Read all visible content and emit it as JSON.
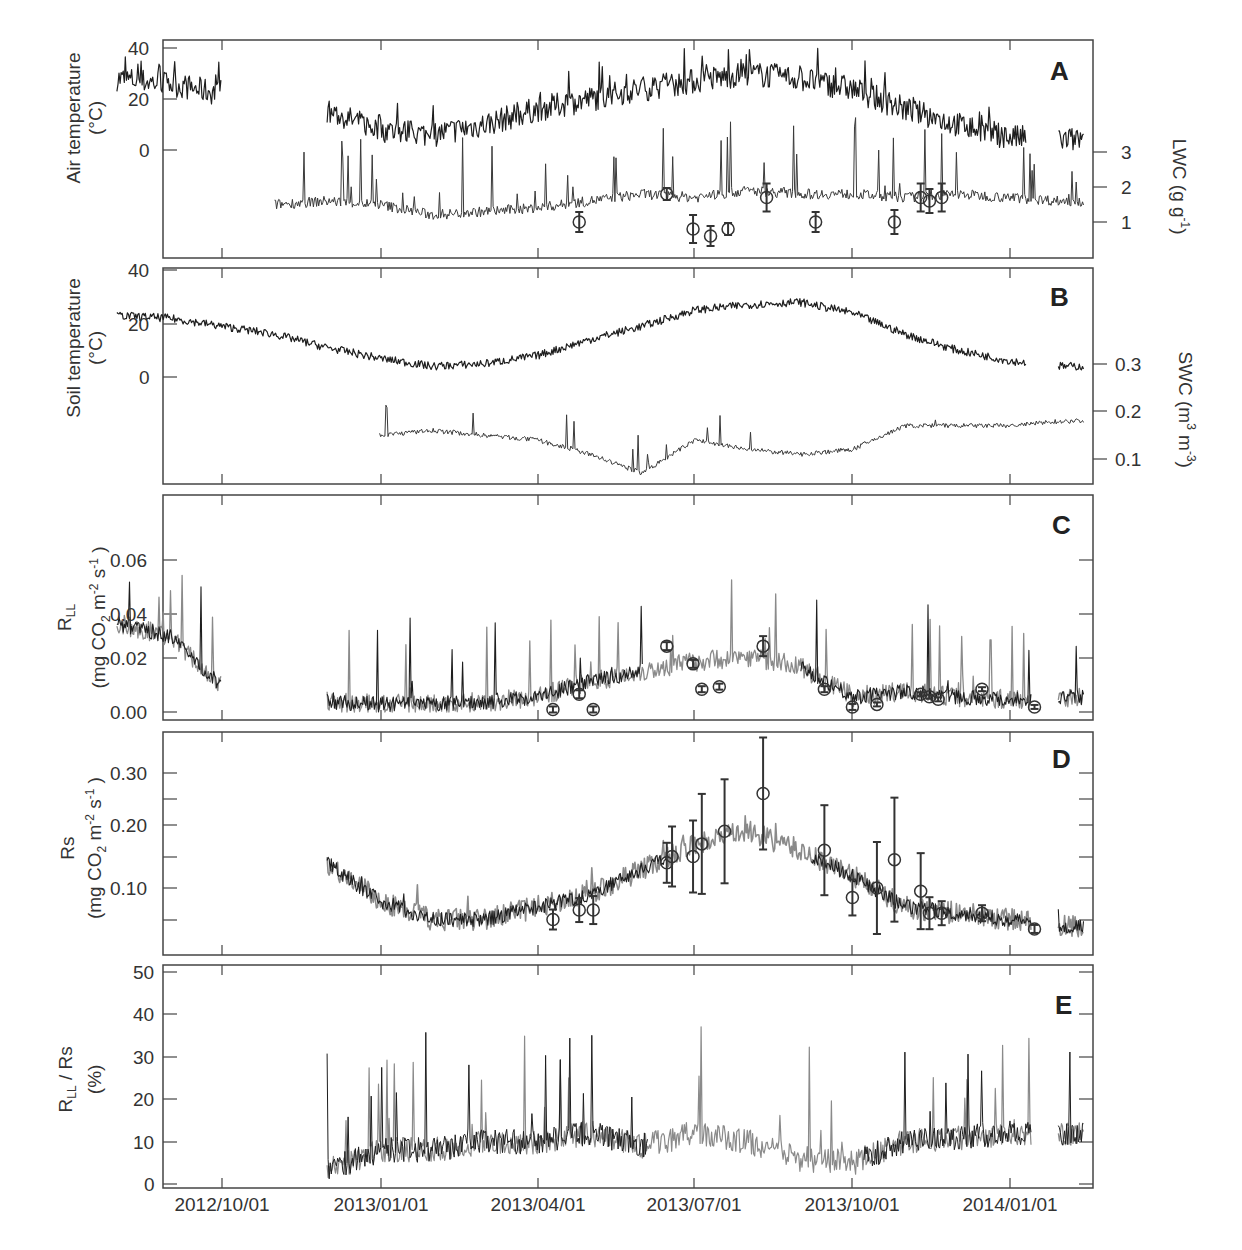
{
  "figure": {
    "x_tick_labels": [
      "2012/10/01",
      "2013/01/01",
      "2013/04/01",
      "2013/07/01",
      "2013/10/01",
      "2014/01/01"
    ]
  },
  "panels": {
    "A": {
      "label": "A",
      "ylabel_line1": "Air temperature",
      "ylabel_line2": "(°C)",
      "yticks": [
        "40",
        "20",
        "0"
      ],
      "right_label": "LWC (g g",
      "right_label_sup": "-1",
      "right_label_end": ")",
      "right_ticks": [
        "3",
        "2",
        "1"
      ]
    },
    "B": {
      "label": "B",
      "ylabel_line1": "Soil temperature",
      "ylabel_line2": "(°C)",
      "yticks": [
        "40",
        "20",
        "0"
      ],
      "right_label": "SWC (m",
      "right_label_sup1": "3",
      "right_label_mid": " m",
      "right_label_sup2": "-3",
      "right_label_end": ")",
      "right_ticks": [
        "0.3",
        "0.2",
        "0.1"
      ]
    },
    "C": {
      "label": "C",
      "ylabel_main": "R",
      "ylabel_sub": "LL",
      "ylabel_unit": "(mg CO",
      "ylabel_unit_sub": "2",
      "ylabel_unit_mid": " m",
      "ylabel_unit_sup1": "-2",
      "ylabel_unit_s": " s",
      "ylabel_unit_sup2": "-1",
      "ylabel_unit_end": " )",
      "yticks": [
        "0.06",
        "0.04",
        "0.02",
        "0.00"
      ]
    },
    "D": {
      "label": "D",
      "ylabel_main": "Rs",
      "ylabel_unit": "(mg CO",
      "ylabel_unit_sub": "2",
      "ylabel_unit_mid": " m",
      "ylabel_unit_sup1": "-2",
      "ylabel_unit_s": " s",
      "ylabel_unit_sup2": "-1",
      "ylabel_unit_end": " )",
      "yticks": [
        "0.30",
        "0.20",
        "0.10"
      ]
    },
    "E": {
      "label": "E",
      "ylabel_main": "R",
      "ylabel_sub": "LL",
      "ylabel_rest": " / Rs",
      "ylabel_unit": "(%)",
      "yticks": [
        "50",
        "40",
        "30",
        "20",
        "10",
        "0"
      ]
    }
  },
  "colors": {
    "axis": "#444444",
    "series_dark": "#1e1e1e",
    "series_gray": "#8a8a8a",
    "marker": "#333333"
  },
  "chart_data": [
    {
      "type": "line",
      "panel": "A",
      "title": "",
      "xlabel": "",
      "ylabel": "Air temperature (°C)",
      "ylim": [
        -44,
        42
      ],
      "x": [
        "2012-08",
        "2012-09",
        "2012-10",
        "2012-11",
        "2012-12",
        "2013-01",
        "2013-02",
        "2013-03",
        "2013-04",
        "2013-05",
        "2013-06",
        "2013-07",
        "2013-08",
        "2013-09",
        "2013-10",
        "2013-11",
        "2013-12",
        "2014-01",
        "2014-02"
      ],
      "series": [
        {
          "name": "Air temperature",
          "axis": "left",
          "values": [
            28,
            26,
            22,
            null,
            15,
            8,
            6,
            10,
            16,
            20,
            24,
            27,
            30,
            28,
            24,
            16,
            10,
            5,
            4
          ]
        },
        {
          "name": "LWC (g g-1)",
          "axis": "right",
          "ylim": [
            0.5,
            3.3
          ],
          "values": [
            null,
            null,
            null,
            1.5,
            1.6,
            1.5,
            1.2,
            1.3,
            1.4,
            1.6,
            1.8,
            1.7,
            1.9,
            1.8,
            1.8,
            1.7,
            1.8,
            1.7,
            1.6
          ]
        }
      ],
      "markers": [
        {
          "date": "2013-04-25",
          "value": 1.0
        },
        {
          "date": "2013-06-15",
          "value": 1.8
        },
        {
          "date": "2013-06-30",
          "value": 0.8
        },
        {
          "date": "2013-07-10",
          "value": 0.6
        },
        {
          "date": "2013-07-20",
          "value": 0.8
        },
        {
          "date": "2013-08-12",
          "value": 1.7
        },
        {
          "date": "2013-09-10",
          "value": 1.0
        },
        {
          "date": "2013-10-25",
          "value": 1.0
        },
        {
          "date": "2013-11-10",
          "value": 1.7
        },
        {
          "date": "2013-11-15",
          "value": 1.6
        },
        {
          "date": "2013-11-22",
          "value": 1.7
        }
      ]
    },
    {
      "type": "line",
      "panel": "B",
      "ylabel": "Soil temperature (°C)",
      "ylim": [
        -40,
        40
      ],
      "x": [
        "2012-08",
        "2012-09",
        "2012-10",
        "2012-11",
        "2012-12",
        "2013-01",
        "2013-02",
        "2013-03",
        "2013-04",
        "2013-05",
        "2013-06",
        "2013-07",
        "2013-08",
        "2013-09",
        "2013-10",
        "2013-11",
        "2013-12",
        "2014-01",
        "2014-02"
      ],
      "series": [
        {
          "name": "Soil temperature",
          "axis": "left",
          "values": [
            23,
            22,
            19,
            16,
            11,
            7,
            4,
            5,
            8,
            14,
            19,
            25,
            27,
            28,
            24,
            16,
            10,
            6,
            4
          ]
        },
        {
          "name": "SWC (m3 m-3)",
          "axis": "right",
          "ylim": [
            0.05,
            0.33
          ],
          "values": [
            null,
            null,
            null,
            null,
            null,
            0.15,
            0.16,
            0.15,
            0.14,
            0.11,
            0.07,
            0.14,
            0.12,
            0.11,
            0.12,
            0.17,
            0.17,
            0.17,
            0.18
          ]
        }
      ]
    },
    {
      "type": "line",
      "panel": "C",
      "ylabel": "RLL (mg CO2 m-2 s-1)",
      "ylim": [
        -0.002,
        0.078
      ],
      "x": [
        "2012-08",
        "2012-09",
        "2012-10",
        "2012-11",
        "2012-12",
        "2013-01",
        "2013-02",
        "2013-03",
        "2013-04",
        "2013-05",
        "2013-06",
        "2013-07",
        "2013-08",
        "2013-09",
        "2013-10",
        "2013-11",
        "2013-12",
        "2014-01",
        "2014-02"
      ],
      "series": [
        {
          "name": "RLL",
          "values": [
            0.035,
            0.03,
            0.01,
            null,
            0.004,
            0.003,
            0.003,
            0.004,
            0.006,
            0.012,
            0.016,
            0.02,
            0.022,
            0.018,
            0.006,
            0.008,
            0.006,
            0.005,
            0.006
          ]
        }
      ],
      "markers": [
        {
          "date": "2013-04-10",
          "value": 0.001
        },
        {
          "date": "2013-04-25",
          "value": 0.007
        },
        {
          "date": "2013-05-03",
          "value": 0.001
        },
        {
          "date": "2013-06-15",
          "value": 0.026
        },
        {
          "date": "2013-06-30",
          "value": 0.019
        },
        {
          "date": "2013-07-05",
          "value": 0.009
        },
        {
          "date": "2013-07-15",
          "value": 0.01
        },
        {
          "date": "2013-08-10",
          "value": 0.026
        },
        {
          "date": "2013-09-15",
          "value": 0.009
        },
        {
          "date": "2013-10-01",
          "value": 0.002
        },
        {
          "date": "2013-10-15",
          "value": 0.003
        },
        {
          "date": "2013-11-10",
          "value": 0.007
        },
        {
          "date": "2013-11-15",
          "value": 0.006
        },
        {
          "date": "2013-11-20",
          "value": 0.005
        },
        {
          "date": "2013-12-15",
          "value": 0.009
        },
        {
          "date": "2014-01-15",
          "value": 0.002
        }
      ]
    },
    {
      "type": "line",
      "panel": "D",
      "ylabel": "Rs (mg CO2 m-2 s-1)",
      "ylim": [
        0.0,
        0.34
      ],
      "x": [
        "2012-08",
        "2012-09",
        "2012-10",
        "2012-11",
        "2012-12",
        "2013-01",
        "2013-02",
        "2013-03",
        "2013-04",
        "2013-05",
        "2013-06",
        "2013-07",
        "2013-08",
        "2013-09",
        "2013-10",
        "2013-11",
        "2013-12",
        "2014-01",
        "2014-02"
      ],
      "series": [
        {
          "name": "Rs",
          "values": [
            null,
            null,
            0.21,
            null,
            0.14,
            0.08,
            0.05,
            0.05,
            0.07,
            0.09,
            0.13,
            0.17,
            0.19,
            0.16,
            0.12,
            0.07,
            0.06,
            0.05,
            0.04
          ]
        }
      ],
      "markers": [
        {
          "date": "2013-04-10",
          "value": 0.05
        },
        {
          "date": "2013-04-25",
          "value": 0.065
        },
        {
          "date": "2013-05-03",
          "value": 0.065
        },
        {
          "date": "2013-06-15",
          "value": 0.14
        },
        {
          "date": "2013-06-18",
          "value": 0.15
        },
        {
          "date": "2013-06-30",
          "value": 0.15
        },
        {
          "date": "2013-07-05",
          "value": 0.17
        },
        {
          "date": "2013-07-18",
          "value": 0.19
        },
        {
          "date": "2013-08-10",
          "value": 0.25
        },
        {
          "date": "2013-09-15",
          "value": 0.16
        },
        {
          "date": "2013-10-01",
          "value": 0.085
        },
        {
          "date": "2013-10-15",
          "value": 0.1
        },
        {
          "date": "2013-10-25",
          "value": 0.145
        },
        {
          "date": "2013-11-10",
          "value": 0.095
        },
        {
          "date": "2013-11-15",
          "value": 0.06
        },
        {
          "date": "2013-11-22",
          "value": 0.06
        },
        {
          "date": "2013-12-15",
          "value": 0.06
        },
        {
          "date": "2014-01-15",
          "value": 0.035
        }
      ]
    },
    {
      "type": "line",
      "panel": "E",
      "ylabel": "RLL / Rs (%)",
      "ylim": [
        0,
        51
      ],
      "x": [
        "2012-08",
        "2012-09",
        "2012-10",
        "2012-11",
        "2012-12",
        "2013-01",
        "2013-02",
        "2013-03",
        "2013-04",
        "2013-05",
        "2013-06",
        "2013-07",
        "2013-08",
        "2013-09",
        "2013-10",
        "2013-11",
        "2013-12",
        "2014-01",
        "2014-02"
      ],
      "series": [
        {
          "name": "RLL/Rs",
          "values": [
            null,
            null,
            6,
            null,
            3,
            8,
            8,
            10,
            10,
            12,
            9,
            12,
            10,
            6,
            5,
            10,
            11,
            12,
            12
          ]
        }
      ]
    }
  ]
}
